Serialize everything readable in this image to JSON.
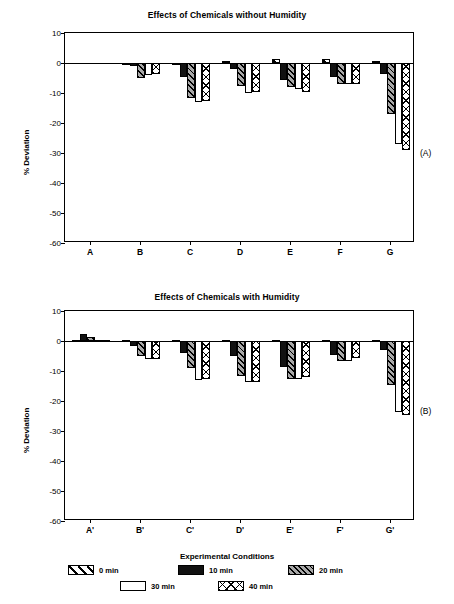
{
  "figure": {
    "panel_a_tag": "(A)",
    "panel_b_tag": "(B)",
    "ylabel": "% Deviation",
    "xlabel": "Experimental Conditions"
  },
  "legend": {
    "position": "bottom",
    "entries": [
      {
        "label": "0 min",
        "pattern": "diagonal-line"
      },
      {
        "label": "10 min",
        "pattern": "solid-black"
      },
      {
        "label": "20 min",
        "pattern": "gray-diagonal"
      },
      {
        "label": "30 min",
        "pattern": "open-white"
      },
      {
        "label": "40 min",
        "pattern": "cross-hatch"
      }
    ]
  },
  "chart_data": [
    {
      "type": "bar",
      "id": "panel-a",
      "title": "Effects of Chemicals without Humidity",
      "xlabel": "",
      "ylabel": "% Deviation",
      "ylim": [
        -60,
        10
      ],
      "yticks": [
        10,
        0,
        -10,
        -20,
        -30,
        -40,
        -50,
        -60
      ],
      "ytick_labels": [
        "10",
        "0",
        "-10",
        "-20",
        "-30",
        "-40",
        "-50",
        "-60"
      ],
      "grid": false,
      "legend_position": "bottom",
      "categories": [
        "A",
        "B",
        "C",
        "D",
        "E",
        "F",
        "G"
      ],
      "series": [
        {
          "name": "0 min",
          "values": [
            0,
            -0.8,
            -0.8,
            0.7,
            1.5,
            1.3,
            0.8
          ]
        },
        {
          "name": "10 min",
          "values": [
            0,
            -1.0,
            -4.5,
            -2.0,
            -5.5,
            -4.5,
            -3.5
          ]
        },
        {
          "name": "20 min",
          "values": [
            0,
            -5.0,
            -11.5,
            -7.5,
            -8.0,
            -7.0,
            -17.0
          ]
        },
        {
          "name": "30 min",
          "values": [
            0,
            -4.0,
            -13.0,
            -10.0,
            -8.5,
            -7.0,
            -27.0
          ]
        },
        {
          "name": "40 min",
          "values": [
            0,
            -3.5,
            -12.5,
            -9.5,
            -9.5,
            -7.0,
            -29.0
          ]
        }
      ]
    },
    {
      "type": "bar",
      "id": "panel-b",
      "title": "Effects of Chemicals with Humidity",
      "xlabel": "Experimental Conditions",
      "ylabel": "% Deviation",
      "ylim": [
        -60,
        10
      ],
      "yticks": [
        10,
        0,
        -10,
        -20,
        -30,
        -40,
        -50,
        -60
      ],
      "ytick_labels": [
        "10",
        "0",
        "-10",
        "-20",
        "-30",
        "-40",
        "-50",
        "-60"
      ],
      "grid": false,
      "legend_position": "bottom",
      "categories": [
        "A'",
        "B'",
        "C'",
        "D'",
        "E'",
        "F'",
        "G'"
      ],
      "series": [
        {
          "name": "0 min",
          "values": [
            0.5,
            0.5,
            0.3,
            0.3,
            0.3,
            0.3,
            0.5
          ]
        },
        {
          "name": "10 min",
          "values": [
            2.2,
            -1.5,
            -4.0,
            -5.0,
            -8.5,
            -4.5,
            -3.0
          ]
        },
        {
          "name": "20 min",
          "values": [
            1.2,
            -5.0,
            -9.0,
            -11.5,
            -12.5,
            -6.5,
            -14.5
          ]
        },
        {
          "name": "30 min",
          "values": [
            0.4,
            -6.0,
            -13.0,
            -13.5,
            -12.5,
            -6.5,
            -23.5
          ]
        },
        {
          "name": "40 min",
          "values": [
            0.2,
            -6.0,
            -12.5,
            -13.5,
            -12.0,
            -5.5,
            -24.5
          ]
        }
      ]
    }
  ]
}
